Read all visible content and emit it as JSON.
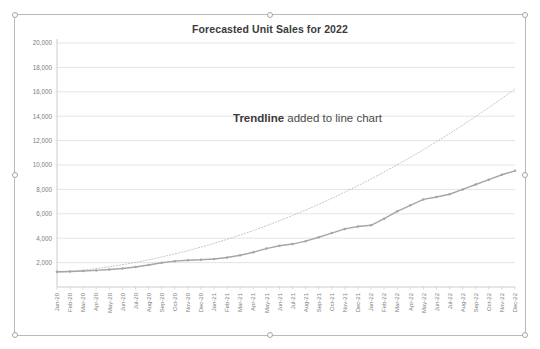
{
  "chart_object": {
    "selected": true,
    "handles": [
      "top-left",
      "top-center",
      "top-right",
      "left-middle",
      "right-middle",
      "bottom-left",
      "bottom-center",
      "bottom-right"
    ]
  },
  "annotation": {
    "strong": "Trendline",
    "rest": " added to line chart"
  },
  "colors": {
    "series_line": "#a6a6a6",
    "trendline": "#bdbdbd",
    "gridline": "#d9d9d9",
    "axis": "#bfbfbf",
    "tick_text": "#7d7d7d",
    "title_text": "#3b3b3b",
    "frame": "#b9b9b9",
    "plot_background": "#ffffff"
  },
  "chart_data": {
    "type": "line",
    "title": "Forecasted Unit Sales for 2022",
    "xlabel": "",
    "ylabel": "",
    "ylim": [
      0,
      20000
    ],
    "yticks": [
      2000,
      4000,
      6000,
      8000,
      10000,
      12000,
      14000,
      16000,
      18000,
      20000
    ],
    "ytick_labels": [
      "2,000",
      "4,000",
      "6,000",
      "8,000",
      "10,000",
      "12,000",
      "14,000",
      "16,000",
      "18,000",
      "20,000"
    ],
    "grid": true,
    "legend": false,
    "legend_position": "none",
    "categories": [
      "Jan-20",
      "Feb-20",
      "Mar-20",
      "Apr-20",
      "May-20",
      "Jun-20",
      "Jul-20",
      "Aug-20",
      "Sep-20",
      "Oct-20",
      "Nov-20",
      "Dec-20",
      "Jan-21",
      "Feb-21",
      "Mar-21",
      "Apr-21",
      "May-21",
      "Jun-21",
      "Jul-21",
      "Aug-21",
      "Sep-21",
      "Oct-21",
      "Nov-21",
      "Dec-21",
      "Jan-22",
      "Feb-22",
      "Mar-22",
      "Apr-22",
      "May-22",
      "Jun-22",
      "Jul-22",
      "Aug-22",
      "Sep-22",
      "Oct-22",
      "Nov-22",
      "Dec-22"
    ],
    "series": [
      {
        "name": "Unit Sales",
        "style": "solid-line-with-markers",
        "color": "#a6a6a6",
        "values": [
          1250,
          1270,
          1310,
          1360,
          1430,
          1520,
          1640,
          1800,
          1990,
          2120,
          2190,
          2230,
          2300,
          2420,
          2600,
          2850,
          3150,
          3380,
          3520,
          3760,
          4080,
          4420,
          4760,
          4960,
          5060,
          5600,
          6200,
          6700,
          7180,
          7380,
          7600,
          8000,
          8400,
          8800,
          9200,
          9520
        ],
        "values_note": "Actual unit sales plotted Jan-20 through Dec-21 (series ends at Dec-21); the x axis continues to Dec-22"
      },
      {
        "name": "Trendline (forecast)",
        "style": "dotted",
        "color": "#bdbdbd",
        "values": [
          1180,
          1270,
          1380,
          1510,
          1660,
          1830,
          2020,
          2230,
          2460,
          2710,
          2980,
          3270,
          3580,
          3910,
          4260,
          4630,
          5020,
          5430,
          5860,
          6310,
          6780,
          7270,
          7780,
          8310,
          8860,
          9430,
          10020,
          10630,
          11260,
          11910,
          12580,
          13270,
          13980,
          14710,
          15460,
          16230
        ],
        "values_note": "Polynomial trendline fitted to the data and extended through Dec-22, ending near 18,800"
      }
    ]
  }
}
